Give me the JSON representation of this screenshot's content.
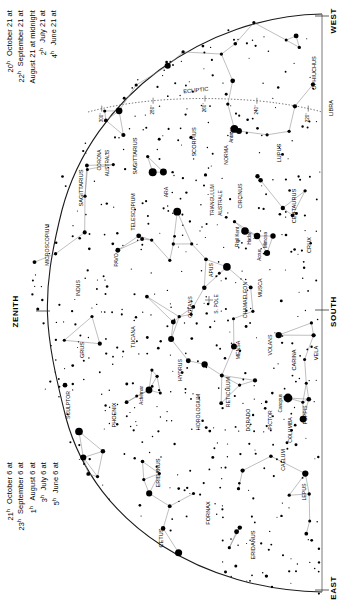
{
  "chart": {
    "cardinals": {
      "west": "WEST",
      "east": "EAST",
      "south": "SOUTH",
      "zenith": "ZENITH"
    },
    "ecliptic_label": "ECLIPTIC",
    "south_pole_label": "S. POLE",
    "ecliptic_ticks": [
      "300°",
      "280°",
      "260°",
      "240°",
      "220°"
    ],
    "colors": {
      "background": "#ffffff",
      "ink": "#000000",
      "horizon": "#1a1a1a",
      "line": "#7a7a7a",
      "ecliptic": "#555555"
    }
  },
  "date_columns": {
    "top": {
      "entries": [
        {
          "date": "June 21 at",
          "time": "4",
          "sup": "h"
        },
        {
          "date": "July 21 at",
          "time": "2",
          "sup": "h"
        },
        {
          "date": "August 21 at midnight",
          "time": "",
          "sup": ""
        },
        {
          "date": "September 21 at",
          "time": "22",
          "sup": "h"
        },
        {
          "date": "October 21 at",
          "time": "20",
          "sup": "h"
        }
      ]
    },
    "bottom": {
      "entries": [
        {
          "date": "June 6 at",
          "time": "5",
          "sup": "h"
        },
        {
          "date": "July 6 at",
          "time": "3",
          "sup": "h"
        },
        {
          "date": "August 6 at",
          "time": "1",
          "sup": "h"
        },
        {
          "date": "September 6 at",
          "time": "23",
          "sup": "h"
        },
        {
          "date": "October 6 at",
          "time": "21",
          "sup": "h"
        }
      ]
    }
  },
  "constellations": [
    {
      "name": "OPHIUCHUS",
      "x": 316,
      "y": 73,
      "rot": -90,
      "size": 5.6
    },
    {
      "name": "LIBRA",
      "x": 333,
      "y": 108,
      "rot": -90,
      "size": 5.6
    },
    {
      "name": "SCORPIUS",
      "x": 196,
      "y": 142,
      "rot": -90,
      "size": 5.6
    },
    {
      "name": "SAGITTARIUS",
      "x": 137,
      "y": 156,
      "rot": -90,
      "size": 5.6
    },
    {
      "name": "SAGITTARIUS",
      "x": 83,
      "y": 188,
      "rot": -90,
      "size": 5.6
    },
    {
      "name": "CORONA",
      "x": 101,
      "y": 160,
      "rot": -90,
      "size": 4.8
    },
    {
      "name": "AUSTRALIS",
      "x": 109,
      "y": 163,
      "rot": -90,
      "size": 4.8
    },
    {
      "name": "LUPUS",
      "x": 281,
      "y": 153,
      "rot": -90,
      "size": 5.6
    },
    {
      "name": "NORMA",
      "x": 228,
      "y": 155,
      "rot": -90,
      "size": 5.2
    },
    {
      "name": "ARA",
      "x": 168,
      "y": 192,
      "rot": -90,
      "size": 5.2
    },
    {
      "name": "TELESCOPIUM",
      "x": 135,
      "y": 212,
      "rot": -90,
      "size": 5.2
    },
    {
      "name": "CIRCINUS",
      "x": 242,
      "y": 196,
      "rot": -90,
      "size": 5.2
    },
    {
      "name": "CENTAURUS",
      "x": 296,
      "y": 206,
      "rot": -90,
      "size": 5.6
    },
    {
      "name": "TRIANGULUM",
      "x": 214,
      "y": 200,
      "rot": -90,
      "size": 4.8
    },
    {
      "name": "AUSTRALE",
      "x": 222,
      "y": 203,
      "rot": -90,
      "size": 4.8
    },
    {
      "name": "CRUX",
      "x": 311,
      "y": 245,
      "rot": -90,
      "size": 5.6
    },
    {
      "name": "MUSCA",
      "x": 262,
      "y": 288,
      "rot": -90,
      "size": 5.2
    },
    {
      "name": "APUS",
      "x": 213,
      "y": 270,
      "rot": -90,
      "size": 5.2
    },
    {
      "name": "PAVO",
      "x": 118,
      "y": 260,
      "rot": -90,
      "size": 5.2
    },
    {
      "name": "INDUS",
      "x": 80,
      "y": 288,
      "rot": -90,
      "size": 5.2
    },
    {
      "name": "MICROSCOPIUM",
      "x": 49,
      "y": 245,
      "rot": -90,
      "size": 5.2
    },
    {
      "name": "CHAMAELEON",
      "x": 247,
      "y": 300,
      "rot": -90,
      "size": 5.2
    },
    {
      "name": "OCTANS",
      "x": 192,
      "y": 307,
      "rot": -90,
      "size": 5.2
    },
    {
      "name": "MENSA",
      "x": 240,
      "y": 350,
      "rot": -90,
      "size": 5.2
    },
    {
      "name": "VOLANS",
      "x": 272,
      "y": 345,
      "rot": -90,
      "size": 5.2
    },
    {
      "name": "CARINA",
      "x": 296,
      "y": 360,
      "rot": -90,
      "size": 5.6
    },
    {
      "name": "VELA",
      "x": 318,
      "y": 353,
      "rot": -90,
      "size": 5.6
    },
    {
      "name": "TUCANA",
      "x": 135,
      "y": 337,
      "rot": -90,
      "size": 5.2
    },
    {
      "name": "GRUS",
      "x": 84,
      "y": 350,
      "rot": -90,
      "size": 5.6
    },
    {
      "name": "HYDRUS",
      "x": 182,
      "y": 370,
      "rot": -90,
      "size": 5.2
    },
    {
      "name": "SCULPTOR",
      "x": 70,
      "y": 405,
      "rot": -90,
      "size": 5.2
    },
    {
      "name": "PHOENIX",
      "x": 116,
      "y": 415,
      "rot": -90,
      "size": 5.6
    },
    {
      "name": "HOROLOGIUM",
      "x": 200,
      "y": 412,
      "rot": -90,
      "size": 5.2
    },
    {
      "name": "RETICULUM",
      "x": 230,
      "y": 392,
      "rot": -90,
      "size": 5.2
    },
    {
      "name": "DORADO",
      "x": 250,
      "y": 420,
      "rot": -90,
      "size": 5.2
    },
    {
      "name": "PICTOR",
      "x": 272,
      "y": 420,
      "rot": -90,
      "size": 5.2
    },
    {
      "name": "CAELUM",
      "x": 285,
      "y": 460,
      "rot": -90,
      "size": 5.2
    },
    {
      "name": "COLUMBA",
      "x": 292,
      "y": 430,
      "rot": -90,
      "size": 5.2
    },
    {
      "name": "PUPPIS",
      "x": 307,
      "y": 415,
      "rot": -90,
      "size": 5.2
    },
    {
      "name": "LEPUS",
      "x": 306,
      "y": 492,
      "rot": -90,
      "size": 5.2
    },
    {
      "name": "ERIDANUS",
      "x": 160,
      "y": 473,
      "rot": -90,
      "size": 5.6
    },
    {
      "name": "ERIDANUS",
      "x": 255,
      "y": 545,
      "rot": -90,
      "size": 5.6
    },
    {
      "name": "FORNAX",
      "x": 210,
      "y": 513,
      "rot": -90,
      "size": 5.6
    },
    {
      "name": "CETUS",
      "x": 163,
      "y": 538,
      "rot": -90,
      "size": 5.6
    }
  ],
  "named_stars": [
    {
      "name": "Antares",
      "x": 239,
      "y": 131,
      "mag": 1.0
    },
    {
      "name": "Rigil Kent",
      "x": 245,
      "y": 231,
      "mag": 0.0
    },
    {
      "name": "Hadar",
      "x": 257,
      "y": 236,
      "mag": 0.6
    },
    {
      "name": "Mimosa",
      "x": 273,
      "y": 236,
      "mag": 1.3
    },
    {
      "name": "Acrux",
      "x": 267,
      "y": 253,
      "mag": 0.8
    },
    {
      "name": "Achernar",
      "x": 149,
      "y": 390,
      "mag": 0.5
    },
    {
      "name": "Canopus",
      "x": 288,
      "y": 398,
      "mag": -0.7
    }
  ]
}
